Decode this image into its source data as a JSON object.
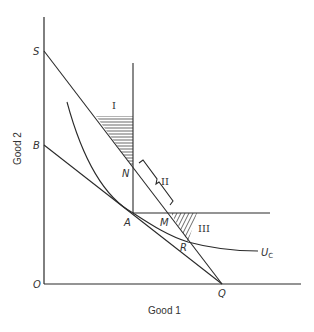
{
  "diagram": {
    "axes": {
      "x_label": "Good 1",
      "y_label": "Good 2",
      "origin_label": "O"
    },
    "points": {
      "S": "S",
      "B": "B",
      "N": "N",
      "A": "A",
      "M": "M",
      "R": "R",
      "Q": "Q"
    },
    "regions": {
      "I": "I",
      "II": "II",
      "III": "III"
    },
    "curve": {
      "label_main": "U",
      "label_sub": "C"
    },
    "colors": {
      "line": "#2a2a2a",
      "text": "#333333",
      "background": "#ffffff"
    }
  }
}
